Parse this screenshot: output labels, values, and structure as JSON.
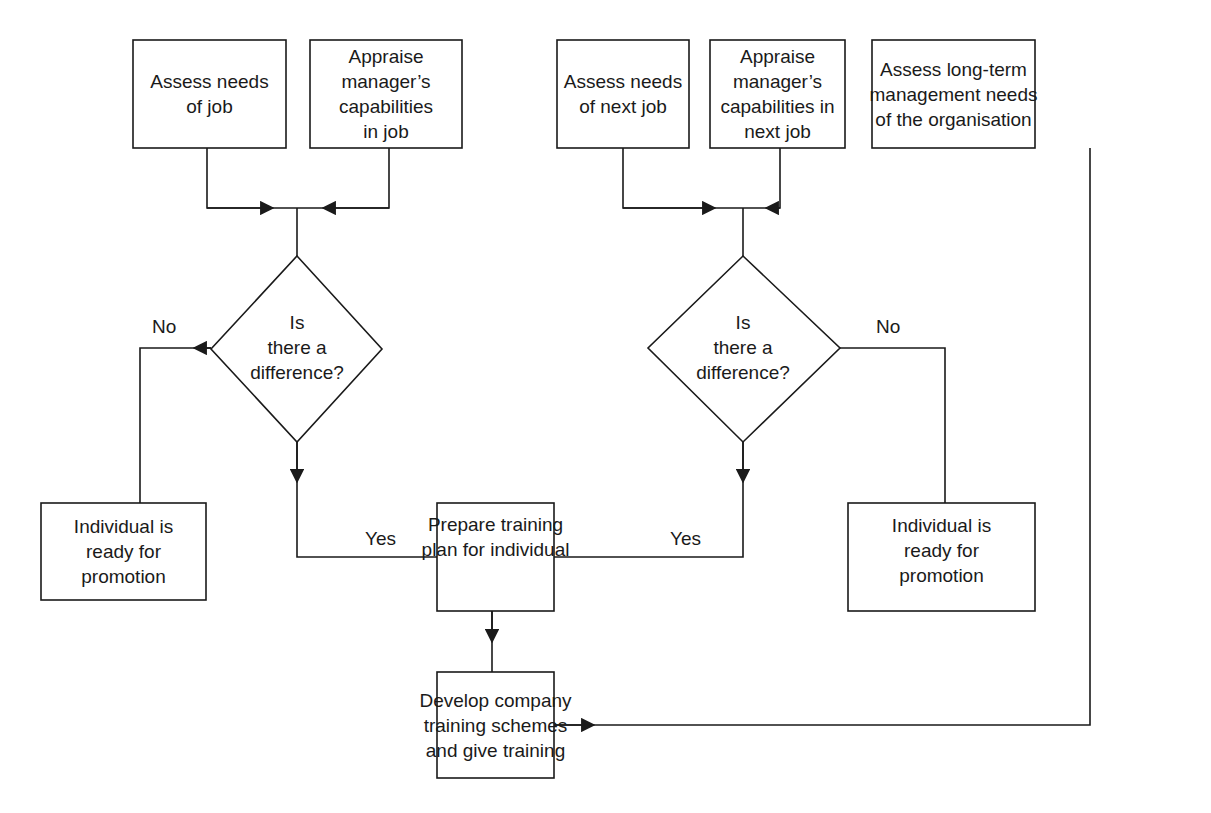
{
  "diagram": {
    "nodes": {
      "assess_job": {
        "lines": [
          "Assess needs",
          "of job"
        ]
      },
      "appraise_job": {
        "lines": [
          "Appraise",
          "manager’s",
          "capabilities",
          "in job"
        ]
      },
      "assess_next": {
        "lines": [
          "Assess needs",
          "of next job"
        ]
      },
      "appraise_next": {
        "lines": [
          "Appraise",
          "manager’s",
          "capabilities in",
          "next job"
        ]
      },
      "assess_longterm": {
        "lines": [
          "Assess long-term",
          "management needs",
          "of the organisation"
        ]
      },
      "decision_left": {
        "lines": [
          "Is",
          "there a",
          "difference?"
        ]
      },
      "decision_right": {
        "lines": [
          "Is",
          "there a",
          "difference?"
        ]
      },
      "ready_left": {
        "lines": [
          "Individual is",
          "ready for",
          "promotion"
        ]
      },
      "ready_right": {
        "lines": [
          "Individual is",
          "ready for",
          "promotion"
        ]
      },
      "prepare_plan": {
        "lines": [
          "Prepare training",
          "plan for individual"
        ]
      },
      "develop_training": {
        "lines": [
          "Develop company",
          "training schemes",
          "and give training"
        ]
      }
    },
    "edges": {
      "left_no": "No",
      "left_yes": "Yes",
      "right_no": "No",
      "right_yes": "Yes"
    },
    "colors": {
      "line": "#1a1a1a",
      "background": "#ffffff"
    }
  }
}
